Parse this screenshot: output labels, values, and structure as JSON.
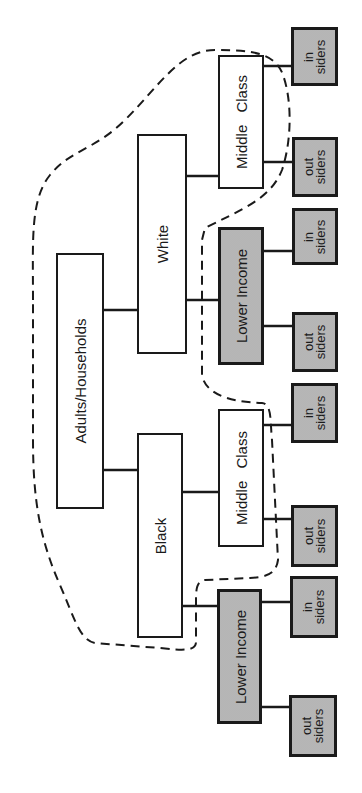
{
  "diagram": {
    "orientation": "rotated -90deg (reads bottom-to-top)",
    "root": {
      "label": "Adults/Households"
    },
    "groups": [
      {
        "label": "White",
        "children": [
          {
            "label": "Middle Class",
            "shaded": false,
            "leaves": [
              {
                "line1": "in",
                "line2": "siders"
              },
              {
                "line1": "out",
                "line2": "siders"
              }
            ]
          },
          {
            "label": "Lower Income",
            "shaded": true,
            "leaves": [
              {
                "line1": "in",
                "line2": "siders"
              },
              {
                "line1": "out",
                "line2": "siders"
              }
            ]
          }
        ]
      },
      {
        "label": "Black",
        "children": [
          {
            "label": "Middle Class",
            "shaded": false,
            "leaves": [
              {
                "line1": "in",
                "line2": "siders"
              },
              {
                "line1": "out",
                "line2": "siders"
              }
            ]
          },
          {
            "label": "Lower Income",
            "shaded": true,
            "leaves": [
              {
                "line1": "in",
                "line2": "siders"
              },
              {
                "line1": "out",
                "line2": "siders"
              }
            ]
          }
        ]
      }
    ],
    "boundary": {
      "style": "dashed",
      "encloses": [
        "Adults/Households",
        "White",
        "Black",
        "White Middle Class",
        "Black Middle Class"
      ]
    },
    "colors": {
      "line": "#1a1a1a",
      "shaded_fill": "#cdcdcd",
      "background": "#ffffff"
    }
  }
}
